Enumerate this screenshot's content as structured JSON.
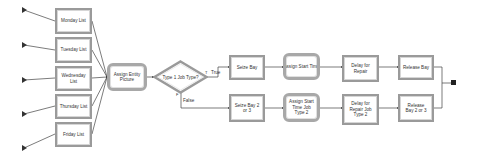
{
  "diagram": {
    "type": "process-flowchart",
    "create_sources": [
      {
        "id": "create-1"
      },
      {
        "id": "create-2"
      },
      {
        "id": "create-3"
      },
      {
        "id": "create-4"
      },
      {
        "id": "create-5"
      }
    ],
    "day_lists": [
      {
        "label": "Monday List"
      },
      {
        "label": "Tuesday List"
      },
      {
        "label": "Wednesday List"
      },
      {
        "label": "Thursday List"
      },
      {
        "label": "Friday List"
      }
    ],
    "assign_entity_picture": {
      "label": "Assign Entity Picture"
    },
    "decision": {
      "label": "Type 1 Job Type?",
      "true_label": "True",
      "false_label": "False",
      "true_marker": "T",
      "false_marker": "F"
    },
    "branch_true": {
      "seize": {
        "label": "Seize Bay"
      },
      "assign": {
        "label": "Assign Start Time"
      },
      "delay": {
        "label": "Delay for Repair"
      },
      "release": {
        "label": "Release Bay"
      }
    },
    "branch_false": {
      "seize": {
        "label": "Seize Bay 2 or 3"
      },
      "assign": {
        "label": "Assign Start Time Job Type 2"
      },
      "delay": {
        "label": "Delay for Repair Job Type 2"
      },
      "release": {
        "label": "Release Bay 2 or 3"
      }
    },
    "dispose": {
      "id": "dispose"
    },
    "colors": {
      "border": "#9a9a9a",
      "line": "#333333",
      "text": "#333333",
      "background": "#ffffff"
    }
  }
}
